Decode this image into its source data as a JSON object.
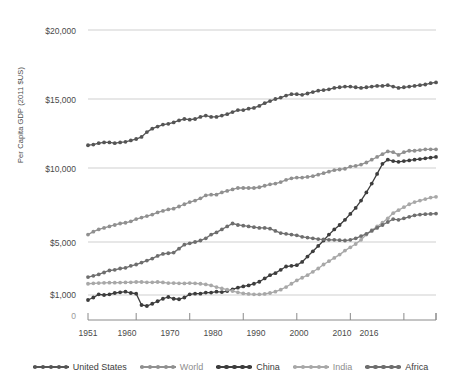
{
  "chart_data": {
    "type": "line",
    "title": "",
    "xlabel": "",
    "ylabel": "Per Capita GDP (2011 $US)",
    "grid": true,
    "legend_position": "bottom",
    "xlim": [
      1951,
      2016
    ],
    "ylim": [
      0,
      20000
    ],
    "x_ticks": [
      "1951",
      "1960",
      "1970",
      "1980",
      "1990",
      "2000",
      "2010",
      "2016"
    ],
    "x_tick_values": [
      1951,
      1960,
      1970,
      1980,
      1990,
      2000,
      2010,
      2016
    ],
    "y_ticks": [
      "0",
      "$1,000",
      "$5,000",
      "$10,000",
      "$15,000",
      "$20,000"
    ],
    "y_tick_values": [
      0,
      1000,
      5000,
      10000,
      15000,
      20000
    ],
    "x": [
      1951,
      1952,
      1953,
      1954,
      1955,
      1956,
      1957,
      1958,
      1959,
      1960,
      1961,
      1962,
      1963,
      1964,
      1965,
      1966,
      1967,
      1968,
      1969,
      1970,
      1971,
      1972,
      1973,
      1974,
      1975,
      1976,
      1977,
      1978,
      1979,
      1980,
      1981,
      1982,
      1983,
      1984,
      1985,
      1986,
      1987,
      1988,
      1989,
      1990,
      1991,
      1992,
      1993,
      1994,
      1995,
      1996,
      1997,
      1998,
      1999,
      2000,
      2001,
      2002,
      2003,
      2004,
      2005,
      2006,
      2007,
      2008,
      2009,
      2010,
      2011,
      2012,
      2013,
      2014,
      2015,
      2016
    ],
    "series": [
      {
        "name": "United States",
        "color": "#555555",
        "values": [
          11650,
          11700,
          11800,
          11850,
          11850,
          11800,
          11850,
          11900,
          12000,
          12100,
          12250,
          12600,
          12850,
          13000,
          13150,
          13200,
          13300,
          13450,
          13550,
          13500,
          13550,
          13700,
          13800,
          13700,
          13700,
          13800,
          13900,
          14050,
          14200,
          14200,
          14300,
          14350,
          14500,
          14700,
          14850,
          15000,
          15100,
          15250,
          15350,
          15350,
          15300,
          15400,
          15500,
          15600,
          15650,
          15700,
          15800,
          15850,
          15900,
          15900,
          15850,
          15800,
          15850,
          15900,
          15950,
          15950,
          16000,
          15900,
          15800,
          15850,
          15900,
          15950,
          16000,
          16050,
          16150,
          16200
        ]
      },
      {
        "name": "World",
        "color": "#909090",
        "values": [
          5500,
          5700,
          5850,
          5950,
          6050,
          6150,
          6250,
          6300,
          6400,
          6550,
          6650,
          6750,
          6850,
          7000,
          7100,
          7200,
          7250,
          7400,
          7550,
          7700,
          7800,
          7950,
          8150,
          8200,
          8200,
          8350,
          8450,
          8550,
          8650,
          8650,
          8650,
          8650,
          8700,
          8800,
          8900,
          8950,
          9050,
          9200,
          9300,
          9350,
          9350,
          9400,
          9450,
          9550,
          9650,
          9750,
          9850,
          9900,
          9950,
          10100,
          10150,
          10250,
          10400,
          10600,
          10800,
          11000,
          11200,
          11150,
          10950,
          11150,
          11250,
          11250,
          11300,
          11350,
          11350,
          11350
        ]
      },
      {
        "name": "China",
        "color": "#3d3d3d",
        "values": [
          800,
          900,
          1050,
          1000,
          1050,
          1150,
          1200,
          1250,
          1150,
          1100,
          600,
          560,
          650,
          750,
          850,
          920,
          850,
          830,
          900,
          1050,
          1100,
          1100,
          1180,
          1180,
          1250,
          1220,
          1300,
          1430,
          1550,
          1650,
          1720,
          1850,
          2000,
          2250,
          2500,
          2650,
          2900,
          3150,
          3200,
          3250,
          3500,
          3900,
          4300,
          4700,
          5100,
          5500,
          5850,
          6150,
          6500,
          6900,
          7300,
          7800,
          8350,
          8950,
          9600,
          10300,
          10600,
          10500,
          10450,
          10500,
          10550,
          10600,
          10650,
          10700,
          10750,
          10800
        ]
      },
      {
        "name": "India",
        "color": "#a8a8a8",
        "values": [
          1850,
          1880,
          1900,
          1920,
          1930,
          1930,
          1940,
          1950,
          1960,
          1980,
          1980,
          1960,
          1960,
          1980,
          1950,
          1900,
          1900,
          1880,
          1870,
          1900,
          1880,
          1850,
          1800,
          1720,
          1600,
          1500,
          1400,
          1300,
          1200,
          1120,
          1080,
          1050,
          1050,
          1080,
          1150,
          1250,
          1400,
          1600,
          1850,
          2100,
          2300,
          2500,
          2750,
          3000,
          3300,
          3550,
          3800,
          4050,
          4350,
          4600,
          4850,
          5150,
          5500,
          5800,
          6050,
          6300,
          6600,
          6950,
          7150,
          7350,
          7550,
          7700,
          7800,
          7900,
          8000,
          8050
        ]
      },
      {
        "name": "Africa",
        "color": "#6e6e6e",
        "values": [
          2350,
          2450,
          2550,
          2700,
          2850,
          2900,
          3000,
          3050,
          3200,
          3300,
          3450,
          3600,
          3750,
          3950,
          4100,
          4150,
          4200,
          4500,
          4800,
          4900,
          5000,
          5100,
          5250,
          5500,
          5650,
          5850,
          6050,
          6250,
          6150,
          6100,
          6050,
          6000,
          5950,
          5950,
          5900,
          5750,
          5600,
          5550,
          5500,
          5450,
          5350,
          5300,
          5250,
          5200,
          5180,
          5150,
          5150,
          5120,
          5100,
          5150,
          5250,
          5400,
          5550,
          5750,
          5950,
          6150,
          6350,
          6550,
          6500,
          6600,
          6700,
          6800,
          6850,
          6880,
          6900,
          6920
        ]
      }
    ]
  },
  "legend": {
    "items": [
      {
        "label": "United States",
        "color": "#555555"
      },
      {
        "label": "World",
        "color": "#909090"
      },
      {
        "label": "China",
        "color": "#3d3d3d"
      },
      {
        "label": "India",
        "color": "#a8a8a8"
      },
      {
        "label": "Africa",
        "color": "#6e6e6e"
      }
    ]
  },
  "axes": {
    "y_title": "Per Capita GDP (2011 $US)",
    "y_labels": [
      "$20,000",
      "$15,000",
      "$10,000",
      "$5,000",
      "$1,000",
      "0"
    ],
    "x_labels": [
      "1951",
      "1960",
      "1970",
      "1980",
      "1990",
      "2000",
      "2010",
      "2016"
    ]
  },
  "colors": {
    "gridline": "#cfcfcf",
    "axis": "#8a8a8a",
    "text": "#4a4a4a",
    "background": "#ffffff"
  }
}
